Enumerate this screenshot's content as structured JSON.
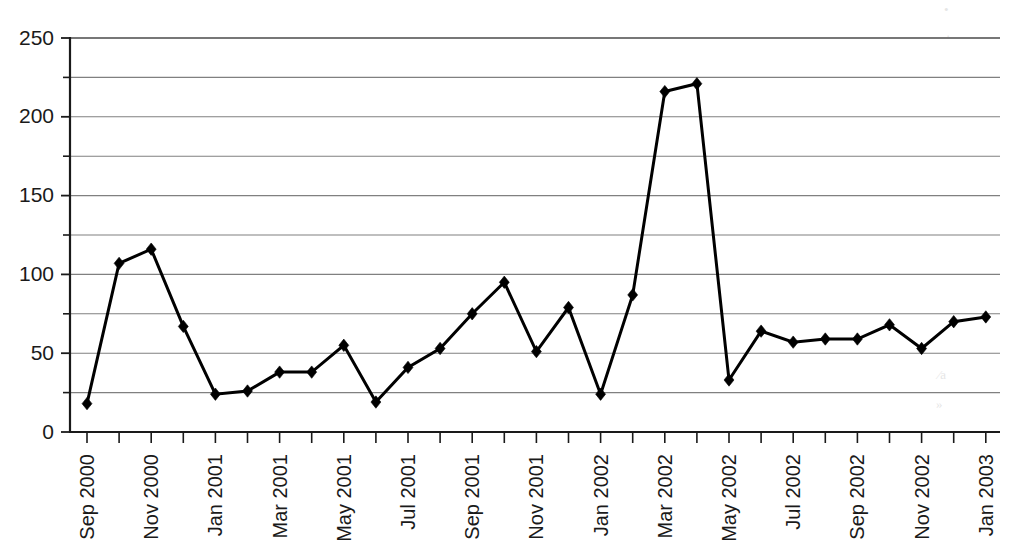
{
  "chart_data": {
    "type": "line",
    "title": "",
    "subtitle": "",
    "xlabel": "",
    "ylabel": "",
    "ylim": [
      0,
      250
    ],
    "y_major_ticks": [
      0,
      50,
      100,
      150,
      200,
      250
    ],
    "y_major_tick_labels": [
      "0",
      "50",
      "100",
      "150",
      "200",
      "250"
    ],
    "y_gridline_values": [
      0,
      25,
      50,
      75,
      100,
      125,
      150,
      175,
      200,
      225,
      250
    ],
    "grid": "horizontal",
    "legend": "none",
    "marker": "diamond",
    "line_color": "#000000",
    "marker_color": "#000000",
    "gridline_color": "#808080",
    "axis_color": "#1a1a1a",
    "categories": [
      "Sep 2000",
      "Oct 2000",
      "Nov 2000",
      "Dec 2000",
      "Jan 2001",
      "Feb 2001",
      "Mar 2001",
      "Apr 2001",
      "May 2001",
      "Jun 2001",
      "Jul 2001",
      "Aug 2001",
      "Sep 2001",
      "Oct 2001",
      "Nov 2001",
      "Dec 2001",
      "Jan 2002",
      "Feb 2002",
      "Mar 2002",
      "Apr 2002",
      "May 2002",
      "Jun 2002",
      "Jul 2002",
      "Aug 2002",
      "Sep 2002",
      "Oct 2002",
      "Nov 2002",
      "Dec 2002",
      "Jan 2003"
    ],
    "x_tick_labels_shown": [
      "Sep 2000",
      "Nov 2000",
      "Jan 2001",
      "Mar 2001",
      "May 2001",
      "Jul 2001",
      "Sep 2001",
      "Nov 2001",
      "Jan 2002",
      "Mar 2002",
      "May 2002",
      "Jul 2002",
      "Sep 2002",
      "Nov 2002",
      "Jan 2003"
    ],
    "x_tick_label_interval": 2,
    "x_tick_label_rotation": -90,
    "values": [
      18,
      107,
      116,
      67,
      24,
      26,
      38,
      38,
      55,
      19,
      41,
      53,
      75,
      95,
      51,
      79,
      24,
      87,
      216,
      221,
      33,
      64,
      57,
      59,
      59,
      68,
      53,
      70,
      73
    ]
  },
  "artifacts": [
    {
      "text": "•",
      "x": 944,
      "y": 14
    },
    {
      "text": "·",
      "x": 946,
      "y": 40
    },
    {
      "text": "⁄a",
      "x": 938,
      "y": 379
    },
    {
      "text": "»",
      "x": 936,
      "y": 408
    }
  ]
}
